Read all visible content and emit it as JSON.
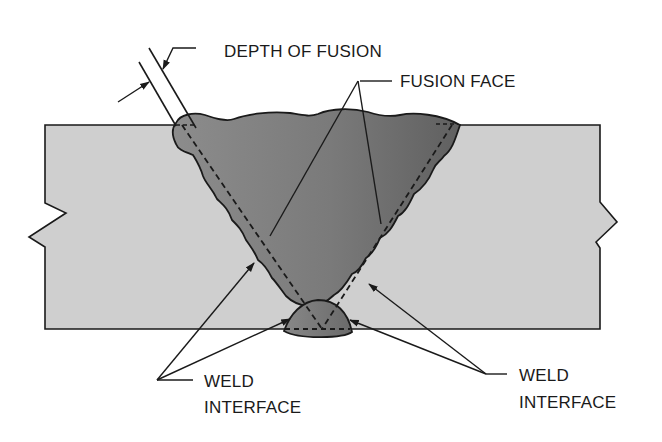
{
  "diagram": {
    "type": "weld-cross-section",
    "labels": {
      "depth_of_fusion": "DEPTH OF FUSION",
      "fusion_face": "FUSION FACE",
      "weld_interface_left_line1": "WELD",
      "weld_interface_left_line2": "INTERFACE",
      "weld_interface_right_line1": "WELD",
      "weld_interface_right_line2": "INTERFACE"
    },
    "colors": {
      "base_metal": "#cfcfcf",
      "weld_metal_left": "#8a8a8a",
      "weld_metal_right": "#6f6f6f",
      "root_bead": "#7e7e7e",
      "outline": "#1a1a1a",
      "background": "#ffffff"
    },
    "elements": [
      "base-plate-left",
      "base-plate-right",
      "weld-bead",
      "root-bead",
      "fusion-face-dashed-lines",
      "leader-lines",
      "break-symbols"
    ]
  }
}
